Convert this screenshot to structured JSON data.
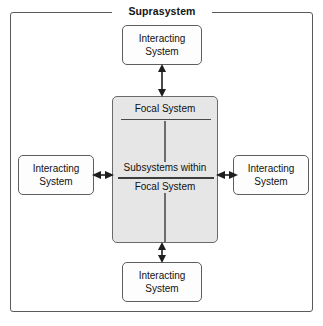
{
  "diagram": {
    "title": "Suprasystem",
    "focal": {
      "title": "Focal System",
      "subsystem_line1": "Subsystems within",
      "subsystem_line2": "Focal System"
    },
    "nodes": {
      "top": {
        "line1": "Interacting",
        "line2": "System"
      },
      "bottom": {
        "line1": "Interacting",
        "line2": "System"
      },
      "left": {
        "line1": "Interacting",
        "line2": "System"
      },
      "right": {
        "line1": "Interacting",
        "line2": "System"
      }
    },
    "colors": {
      "frame_border": "#5a5a5a",
      "node_border": "#5e5e5e",
      "node_fill": "#fdfdfd",
      "focal_fill": "#e6e6e6",
      "focal_border": "#6a6a6a",
      "rule": "#3d3d3d",
      "arrow": "#1e1e1e",
      "text": "#111111",
      "background": "#ffffff"
    }
  }
}
